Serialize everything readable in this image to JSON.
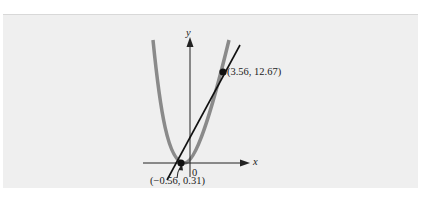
{
  "figure": {
    "axes": {
      "x_label": "x",
      "y_label": "y",
      "origin_label": "0"
    },
    "curve": {
      "description": "parabola",
      "color": "#8a8a8a"
    },
    "line": {
      "description": "secant line",
      "color": "#111111"
    },
    "points": [
      {
        "label": "(3.56, 12.67)",
        "x": 3.56,
        "y": 12.67
      },
      {
        "label": "(−0.56, 0.31)",
        "x": -0.56,
        "y": 0.31
      }
    ],
    "colors": {
      "background": "#efefef",
      "axis": "#222222"
    }
  }
}
